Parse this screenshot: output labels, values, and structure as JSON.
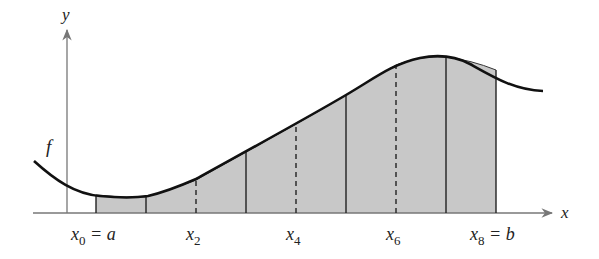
{
  "diagram": {
    "axes": {
      "x_label": "x",
      "y_label": "y"
    },
    "function_label": "f",
    "tick_labels": [
      {
        "base": "x",
        "sub": "0",
        "suffix": " = a"
      },
      {
        "base": "x",
        "sub": "2",
        "suffix": ""
      },
      {
        "base": "x",
        "sub": "4",
        "suffix": ""
      },
      {
        "base": "x",
        "sub": "6",
        "suffix": ""
      },
      {
        "base": "x",
        "sub": "8",
        "suffix": " = b"
      }
    ],
    "partition_count": 8,
    "colors": {
      "shade": "#c8c8c8",
      "curve": "#111111",
      "axis": "#777777"
    }
  }
}
